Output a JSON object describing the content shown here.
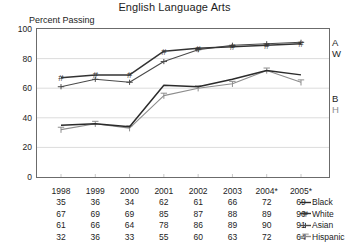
{
  "chart_data": {
    "type": "line",
    "title": "English Language Arts",
    "ylabel": "Percent Passing",
    "xlabel": "",
    "ylim": [
      0,
      100
    ],
    "yticks": [
      0,
      20,
      40,
      60,
      80,
      100
    ],
    "grid": true,
    "legend_position": "right-of-table",
    "categories": [
      "1998",
      "1999",
      "2000",
      "2001",
      "2002",
      "2003",
      "2004*",
      "2005*"
    ],
    "series": [
      {
        "name": "Black",
        "short": "B",
        "marker": "line",
        "color": "#2b2b2b",
        "values": [
          35,
          36,
          34,
          62,
          61,
          66,
          72,
          69
        ]
      },
      {
        "name": "White",
        "short": "W",
        "marker": "hash",
        "color": "#333333",
        "values": [
          67,
          69,
          69,
          85,
          87,
          88,
          89,
          90
        ]
      },
      {
        "name": "Asian",
        "short": "A",
        "marker": "plus",
        "color": "#4a4a4a",
        "values": [
          61,
          66,
          64,
          78,
          86,
          89,
          90,
          91
        ]
      },
      {
        "name": "Hispanic",
        "short": "H",
        "marker": "tee",
        "color": "#8d8d8d",
        "values": [
          32,
          36,
          33,
          55,
          60,
          63,
          72,
          64
        ]
      }
    ],
    "annotations": [
      "2004 and 2005 marked with asterisk"
    ]
  },
  "end_labels": [
    {
      "text": "A"
    },
    {
      "text": "W"
    },
    {
      "text": "B"
    },
    {
      "text": "H"
    }
  ]
}
